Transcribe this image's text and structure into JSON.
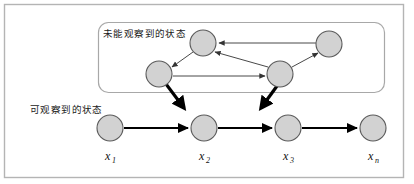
{
  "figure": {
    "title_alt": "Hidden Markov Model diagram",
    "background_color": "#ffffff",
    "outer_frame": {
      "stroke": "#b4b4b4",
      "fill": "#ffffff",
      "x": 4,
      "y": 4,
      "width": 400,
      "height": 174
    },
    "hidden_box": {
      "label": "未能观察到的状态",
      "label_x": 103,
      "label_y": 37,
      "stroke": "#a8a8a8",
      "fill": "#ffffff",
      "x": 98,
      "y": 22,
      "width": 287,
      "height": 71,
      "rx": 10
    },
    "observed_label": {
      "label": "可观察到的状态",
      "label_x": 30,
      "label_y": 113
    },
    "node_style": {
      "fill": "#d2d2d2",
      "stroke": "#5a5a5a",
      "stroke_width": 1.1,
      "radius": 13
    },
    "hidden_nodes": [
      {
        "id": "h-top-left",
        "cx": 203,
        "cy": 43
      },
      {
        "id": "h-top-right",
        "cx": 329,
        "cy": 44
      },
      {
        "id": "h-mid-left",
        "cx": 159,
        "cy": 74
      },
      {
        "id": "h-mid-right",
        "cx": 280,
        "cy": 74
      }
    ],
    "observed_nodes": [
      {
        "id": "x1",
        "cx": 110,
        "cy": 128,
        "label": "x",
        "sub": "1",
        "label_x": 106,
        "label_y": 158
      },
      {
        "id": "x2",
        "cx": 204,
        "cy": 128,
        "label": "x",
        "sub": "2",
        "label_x": 200,
        "label_y": 158
      },
      {
        "id": "x3",
        "cx": 288,
        "cy": 128,
        "label": "x",
        "sub": "3",
        "label_x": 284,
        "label_y": 158
      },
      {
        "id": "xn",
        "cx": 373,
        "cy": 128,
        "label": "x",
        "sub": "n",
        "label_x": 369,
        "label_y": 158
      }
    ],
    "thin_arrows": [
      {
        "id": "arrow-topright-to-topleft",
        "x1": 316,
        "y1": 43,
        "x2": 218,
        "y2": 43
      },
      {
        "id": "arrow-topleft-to-midleft",
        "x1": 192,
        "y1": 51,
        "x2": 171,
        "y2": 67
      },
      {
        "id": "arrow-midright-to-topleft",
        "x1": 268,
        "y1": 67,
        "x2": 214,
        "y2": 51
      },
      {
        "id": "arrow-midright-to-topright",
        "x1": 292,
        "y1": 67,
        "x2": 318,
        "y2": 52
      },
      {
        "id": "arrow-midleft-to-midright",
        "x1": 173,
        "y1": 76,
        "x2": 266,
        "y2": 76
      }
    ],
    "thick_arrows": [
      {
        "id": "emission-arrow-1",
        "x1": 166,
        "y1": 84,
        "x2": 186,
        "y2": 110
      },
      {
        "id": "emission-arrow-2",
        "x1": 277,
        "y1": 86,
        "x2": 259,
        "y2": 110
      }
    ],
    "chain_arrows": [
      {
        "id": "chain-x1-x2",
        "x1": 124,
        "y1": 128,
        "x2": 189,
        "y2": 128
      },
      {
        "id": "chain-x2-x3",
        "x1": 218,
        "y1": 128,
        "x2": 273,
        "y2": 128
      },
      {
        "id": "chain-x3-xn",
        "x1": 302,
        "y1": 128,
        "x2": 358,
        "y2": 128
      }
    ],
    "colors": {
      "node_fill": "#d2d2d2",
      "node_stroke": "#5a5a5a",
      "thin_arrow": "#333333",
      "thick_arrow": "#000000",
      "frame": "#b4b4b4",
      "text": "#1a1a1a"
    }
  }
}
